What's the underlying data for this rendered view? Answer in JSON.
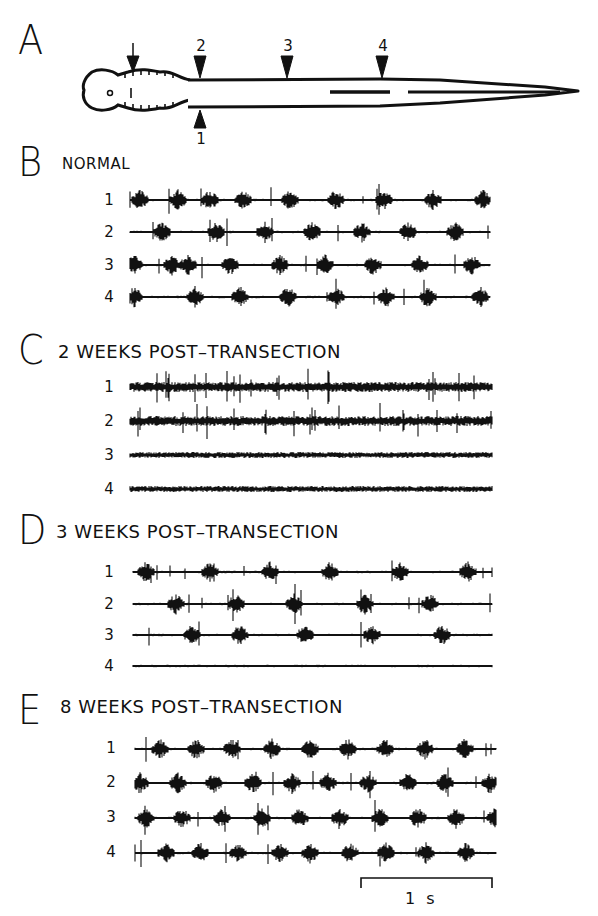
{
  "figure": {
    "panel_a": {
      "letter": "A",
      "diagram": "larval lamprey schematic with transection arrow and recording sites",
      "markers": [
        {
          "label": "",
          "position": "dorsal",
          "meaning": "transection site",
          "x": 133
        },
        {
          "label": "2",
          "position": "dorsal",
          "x": 200
        },
        {
          "label": "3",
          "position": "dorsal",
          "x": 287
        },
        {
          "label": "4",
          "position": "dorsal",
          "x": 382
        },
        {
          "label": "1",
          "position": "ventral",
          "x": 200
        }
      ]
    },
    "panels": [
      {
        "letter": "B",
        "title": "NORMAL",
        "channels": [
          "1",
          "2",
          "3",
          "4"
        ]
      },
      {
        "letter": "C",
        "title": "2 WEEKS POST–TRANSECTION",
        "channels": [
          "1",
          "2",
          "3",
          "4"
        ]
      },
      {
        "letter": "D",
        "title": "3 WEEKS POST–TRANSECTION",
        "channels": [
          "1",
          "2",
          "3",
          "4"
        ]
      },
      {
        "letter": "E",
        "title": "8 WEEKS POST–TRANSECTION",
        "channels": [
          "1",
          "2",
          "3",
          "4"
        ]
      }
    ],
    "scale_bar": {
      "label": "1 s"
    }
  },
  "chart_data": {
    "type": "line",
    "xlabel": "time",
    "ylabel": "",
    "scale_bar": "1 s",
    "panels": [
      {
        "id": "B",
        "title": "NORMAL",
        "series": [
          {
            "name": "1",
            "bursts_x_px": [
              140,
              178,
              210,
              243,
              290,
              336,
              384,
              433,
              483
            ],
            "pattern": "rhythmic bursts"
          },
          {
            "name": "2",
            "bursts_x_px": [
              162,
              216,
              265,
              312,
              362,
              408,
              455
            ],
            "pattern": "rhythmic bursts, phase-lagged"
          },
          {
            "name": "3",
            "bursts_x_px": [
              134,
              172,
              188,
              230,
              280,
              325,
              373,
              420,
              472
            ],
            "pattern": "rhythmic bursts, phase-lagged"
          },
          {
            "name": "4",
            "bursts_x_px": [
              134,
              195,
              240,
              288,
              336,
              386,
              428,
              480
            ],
            "pattern": "rhythmic bursts, phase-lagged"
          }
        ]
      },
      {
        "id": "C",
        "title": "2 WEEKS POST–TRANSECTION",
        "series": [
          {
            "name": "1",
            "pattern": "tonic high-amplitude activity"
          },
          {
            "name": "2",
            "pattern": "tonic activity with irregular spikes"
          },
          {
            "name": "3",
            "pattern": "low tonic noise, no bursts"
          },
          {
            "name": "4",
            "pattern": "low tonic noise, no bursts"
          }
        ]
      },
      {
        "id": "D",
        "title": "3 WEEKS POST–TRANSECTION",
        "series": [
          {
            "name": "1",
            "bursts_x_px": [
              146,
              210,
              270,
              330,
              400,
              468
            ],
            "pattern": "rhythmic bursts"
          },
          {
            "name": "2",
            "bursts_x_px": [
              176,
              236,
              294,
              365,
              430
            ],
            "pattern": "rhythmic bursts"
          },
          {
            "name": "3",
            "bursts_x_px": [
              192,
              240,
              305,
              372,
              442
            ],
            "pattern": "rhythmic bursts"
          },
          {
            "name": "4",
            "pattern": "flat, no bursts"
          }
        ]
      },
      {
        "id": "E",
        "title": "8 WEEKS POST–TRANSECTION",
        "series": [
          {
            "name": "1",
            "bursts_x_px": [
              160,
              196,
              232,
              272,
              310,
              348,
              385,
              425,
              465
            ],
            "pattern": "rhythmic bursts"
          },
          {
            "name": "2",
            "bursts_x_px": [
              140,
              178,
              214,
              253,
              292,
              328,
              368,
              408,
              445,
              490
            ],
            "pattern": "rhythmic bursts"
          },
          {
            "name": "3",
            "bursts_x_px": [
              146,
              182,
              222,
              262,
              300,
              340,
              380,
              418,
              456,
              495
            ],
            "pattern": "rhythmic bursts"
          },
          {
            "name": "4",
            "bursts_x_px": [
              166,
              200,
              238,
              280,
              310,
              350,
              386,
              426,
              466
            ],
            "pattern": "rhythmic bursts"
          }
        ]
      }
    ]
  }
}
